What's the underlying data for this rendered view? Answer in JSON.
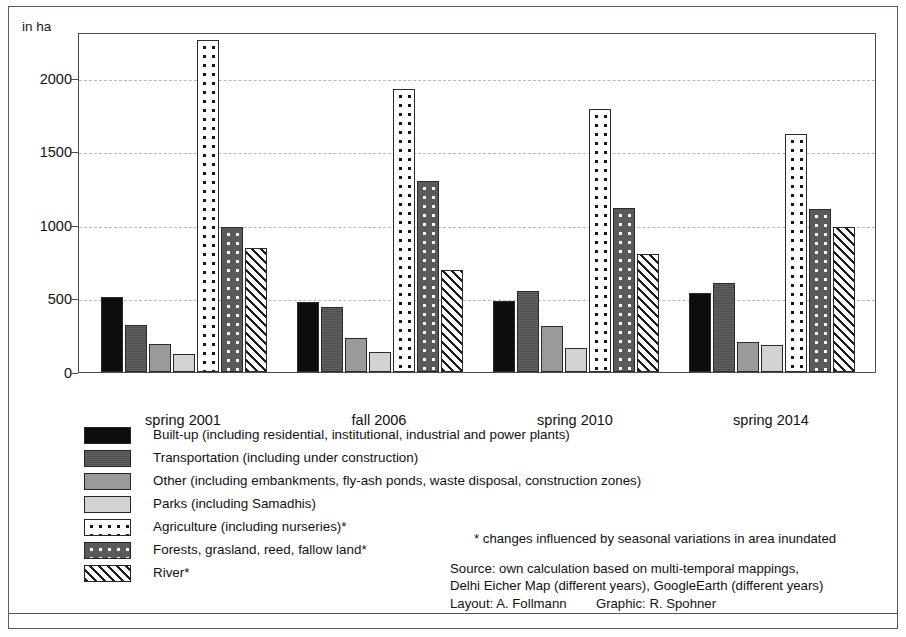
{
  "axis": {
    "unit_label": "in ha",
    "y_ticks": [
      0,
      500,
      1000,
      1500,
      2000
    ],
    "y_tick_labels": [
      "0",
      "500",
      "1000",
      "1500",
      "2000"
    ]
  },
  "legend": {
    "items": [
      {
        "key": "builtup",
        "swatch": "fill-builtup",
        "label": "Built-up (including residential, institutional, industrial and power plants)"
      },
      {
        "key": "transport",
        "swatch": "fill-transport",
        "label": "Transportation (including under construction)"
      },
      {
        "key": "other",
        "swatch": "fill-other",
        "label": "Other (including embankments, fly-ash ponds, waste disposal, construction zones)"
      },
      {
        "key": "parks",
        "swatch": "fill-parks",
        "label": "Parks (including Samadhis)"
      },
      {
        "key": "agri",
        "swatch": "fill-agri",
        "label": "Agriculture (including nurseries)*"
      },
      {
        "key": "forest",
        "swatch": "fill-forest",
        "label": "Forests, grasland, reed, fallow land*"
      },
      {
        "key": "river",
        "swatch": "fill-river",
        "label": "River*"
      }
    ]
  },
  "notes": {
    "footnote": "* changes influenced by seasonal variations in area inundated",
    "source_line_1": "Source: own calculation based on multi-temporal mappings,",
    "source_line_2": "Delhi Eicher Map (different years), GoogleEarth (different years)",
    "credit_layout": "Layout: A. Follmann",
    "credit_graphic": "Graphic: R. Spohner"
  },
  "chart_data": {
    "type": "bar",
    "title": "",
    "xlabel": "",
    "ylabel": "in ha",
    "ylim": [
      0,
      2310
    ],
    "grid": true,
    "legend_position": "below-left",
    "categories": [
      "spring 2001",
      "fall 2006",
      "spring 2010",
      "spring 2014"
    ],
    "series": [
      {
        "name": "Built-up (including residential, institutional, industrial and power plants)",
        "key": "builtup",
        "fill": "fill-builtup",
        "values": [
          510,
          475,
          480,
          540
        ]
      },
      {
        "name": "Transportation (including under construction)",
        "key": "transport",
        "fill": "fill-transport",
        "values": [
          320,
          445,
          550,
          605
        ]
      },
      {
        "name": "Other (including embankments, fly-ash ponds, waste disposal, construction zones)",
        "key": "other",
        "fill": "fill-other",
        "values": [
          190,
          230,
          310,
          205
        ]
      },
      {
        "name": "Parks (including Samadhis)",
        "key": "parks",
        "fill": "fill-parks",
        "values": [
          125,
          135,
          165,
          185
        ]
      },
      {
        "name": "Agriculture (including nurseries)*",
        "key": "agri",
        "fill": "fill-agri",
        "values": [
          2255,
          1920,
          1790,
          1615
        ]
      },
      {
        "name": "Forests, grasland, reed, fallow land*",
        "key": "forest",
        "fill": "fill-forest",
        "values": [
          985,
          1300,
          1115,
          1110
        ]
      },
      {
        "name": "River*",
        "key": "river",
        "fill": "fill-river",
        "values": [
          840,
          690,
          800,
          985
        ]
      }
    ]
  }
}
